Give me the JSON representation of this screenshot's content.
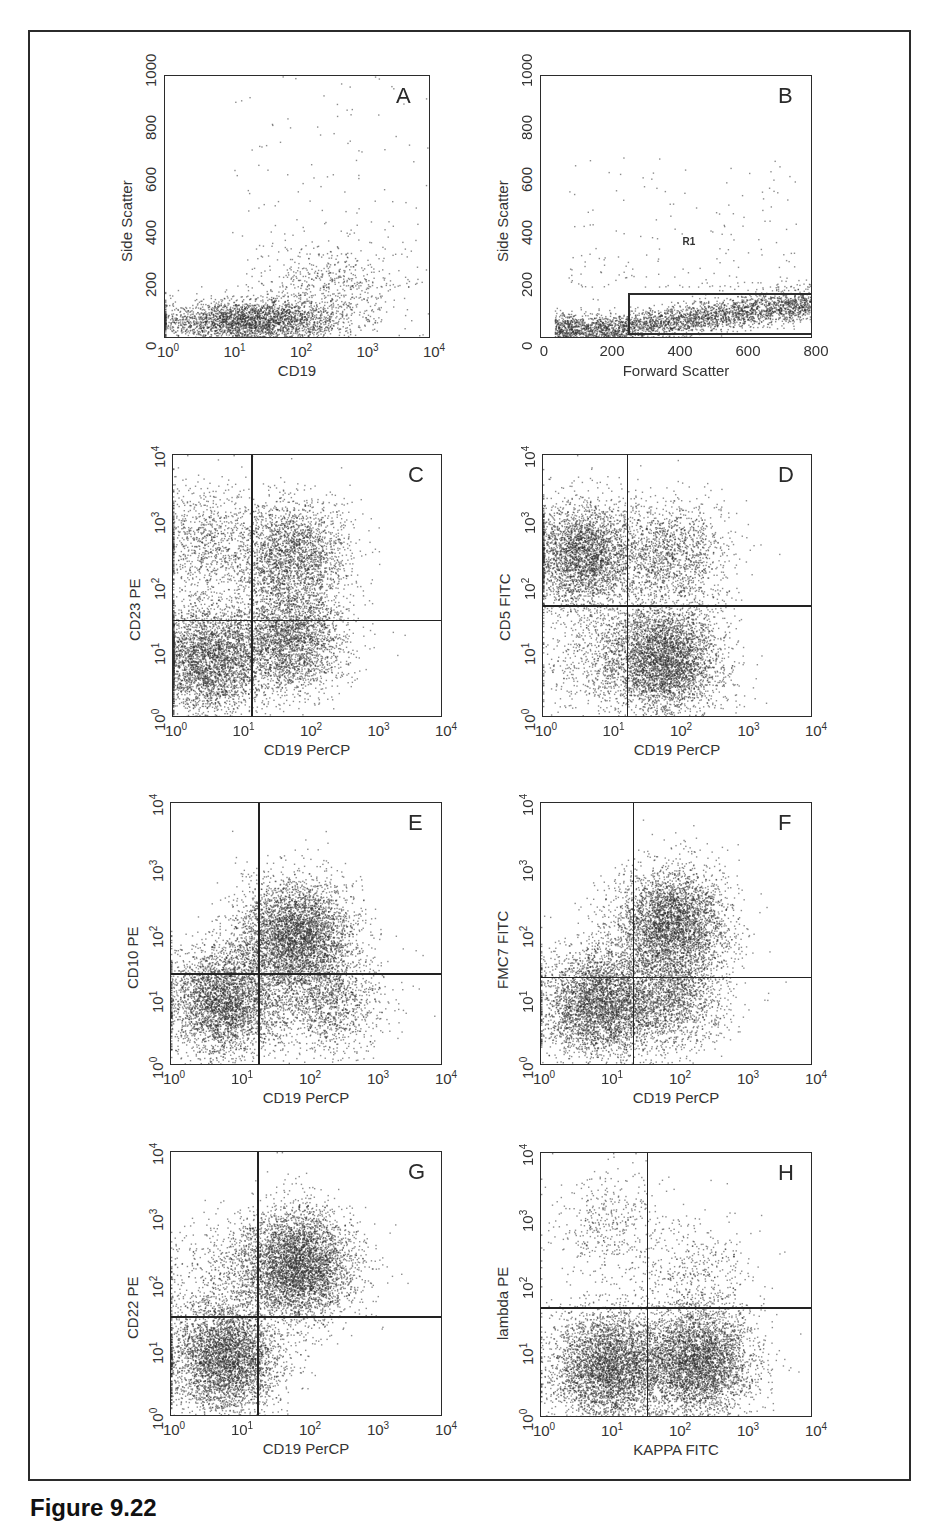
{
  "figure": {
    "caption": "Figure 9.22",
    "colors": {
      "frame": "#2b2b2b",
      "dots": "#3a3a3a",
      "background": "#ffffff"
    }
  },
  "chart_data": [
    {
      "id": "A",
      "type": "scatter",
      "title": "A",
      "xlabel": "CD19",
      "ylabel": "Side Scatter",
      "xscale": "log",
      "xlim": [
        1,
        10000
      ],
      "xticks": [
        "10^0",
        "10^1",
        "10^2",
        "10^3",
        "10^4"
      ],
      "yscale": "linear",
      "ylim": [
        0,
        1000
      ],
      "yticks": [
        "0",
        "200",
        "400",
        "600",
        "800",
        "1000"
      ],
      "populations": [
        {
          "description": "main lymphocyte cloud",
          "x_center": 20,
          "y_center": 70,
          "x_spread_log": 0.7,
          "y_spread": 40,
          "weight": 0.8
        },
        {
          "description": "diagonal tail",
          "x_center": 300,
          "y_center": 200,
          "x_spread_log": 0.5,
          "y_spread": 80,
          "weight": 0.15
        },
        {
          "description": "sparse high outliers",
          "x_range": [
            10,
            10000
          ],
          "y_range": [
            200,
            1000
          ],
          "weight": 0.05
        }
      ]
    },
    {
      "id": "B",
      "type": "scatter",
      "title": "B",
      "xlabel": "Forward Scatter",
      "ylabel": "Side Scatter",
      "xscale": "linear",
      "xlim": [
        0,
        1000
      ],
      "xticks": [
        "0",
        "200",
        "400",
        "600",
        "800",
        "1000"
      ],
      "yscale": "linear",
      "ylim": [
        0,
        1000
      ],
      "yticks": [
        "0",
        "200",
        "400",
        "600",
        "800",
        "1000"
      ],
      "gates": [
        {
          "label": "R1",
          "x": [
            320,
            1010
          ],
          "y": [
            15,
            175
          ]
        }
      ],
      "populations": [
        {
          "description": "debris",
          "x_range": [
            50,
            320
          ],
          "y_center": 40,
          "y_spread": 30,
          "weight": 0.3
        },
        {
          "description": "gated lymphocytes",
          "x_range": [
            320,
            1010
          ],
          "y_trend": "60 to 160",
          "weight": 0.65
        },
        {
          "description": "outliers",
          "x_range": [
            100,
            950
          ],
          "y_range": [
            200,
            700
          ],
          "weight": 0.05
        }
      ]
    },
    {
      "id": "C",
      "type": "scatter",
      "title": "C",
      "xlabel": "CD19 PerCP",
      "ylabel": "CD23 PE",
      "xscale": "log",
      "xlim": [
        1,
        10000
      ],
      "yscale": "log",
      "ylim": [
        1,
        10000
      ],
      "xticks": [
        "10^0",
        "10^1",
        "10^2",
        "10^3",
        "10^4"
      ],
      "yticks": [
        "10^0",
        "10^1",
        "10^2",
        "10^3",
        "10^4"
      ],
      "quadrant": {
        "x": 15,
        "y": 30
      },
      "populations": [
        {
          "x_center": 3,
          "y_center": 8,
          "weight": 0.35
        },
        {
          "x_center": 50,
          "y_center": 15,
          "weight": 0.3
        },
        {
          "x_center": 60,
          "y_center": 300,
          "weight": 0.25
        },
        {
          "x_center": 3,
          "y_center": 500,
          "weight": 0.1
        }
      ]
    },
    {
      "id": "D",
      "type": "scatter",
      "title": "D",
      "xlabel": "CD19 PerCP",
      "ylabel": "CD5 FITC",
      "xscale": "log",
      "xlim": [
        1,
        10000
      ],
      "yscale": "log",
      "ylim": [
        1,
        10000
      ],
      "xticks": [
        "10^0",
        "10^1",
        "10^2",
        "10^3",
        "10^4"
      ],
      "yticks": [
        "10^0",
        "10^1",
        "10^2",
        "10^3",
        "10^4"
      ],
      "quadrant": {
        "x": 18,
        "y": 50
      },
      "populations": [
        {
          "x_center": 4,
          "y_center": 300,
          "weight": 0.35
        },
        {
          "x_center": 60,
          "y_center": 8,
          "weight": 0.45
        },
        {
          "x_center": 80,
          "y_center": 300,
          "weight": 0.15
        },
        {
          "x_center": 5,
          "y_center": 8,
          "weight": 0.05
        }
      ]
    },
    {
      "id": "E",
      "type": "scatter",
      "title": "E",
      "xlabel": "CD19 PerCP",
      "ylabel": "CD10 PE",
      "xscale": "log",
      "xlim": [
        1,
        10000
      ],
      "yscale": "log",
      "ylim": [
        1,
        10000
      ],
      "xticks": [
        "10^0",
        "10^1",
        "10^2",
        "10^3",
        "10^4"
      ],
      "yticks": [
        "10^0",
        "10^1",
        "10^2",
        "10^3",
        "10^4"
      ],
      "quadrant": {
        "x": 20,
        "y": 25
      },
      "populations": [
        {
          "x_center": 6,
          "y_center": 10,
          "weight": 0.4
        },
        {
          "x_center": 70,
          "y_center": 100,
          "weight": 0.45
        },
        {
          "x_center": 200,
          "y_center": 10,
          "weight": 0.15
        }
      ]
    },
    {
      "id": "F",
      "type": "scatter",
      "title": "F",
      "xlabel": "CD19 PerCP",
      "ylabel": "FMC7 FITC",
      "xscale": "log",
      "xlim": [
        1,
        10000
      ],
      "yscale": "log",
      "ylim": [
        1,
        10000
      ],
      "xticks": [
        "10^0",
        "10^1",
        "10^2",
        "10^3",
        "10^4"
      ],
      "yticks": [
        "10^0",
        "10^1",
        "10^2",
        "10^3",
        "10^4"
      ],
      "quadrant": {
        "x": 23,
        "y": 22
      },
      "populations": [
        {
          "x_center": 7,
          "y_center": 9,
          "weight": 0.4
        },
        {
          "x_center": 80,
          "y_center": 150,
          "weight": 0.4
        },
        {
          "x_center": 80,
          "y_center": 12,
          "weight": 0.2
        }
      ]
    },
    {
      "id": "G",
      "type": "scatter",
      "title": "G",
      "xlabel": "CD19 PerCP",
      "ylabel": "CD22 PE",
      "xscale": "log",
      "xlim": [
        1,
        10000
      ],
      "yscale": "log",
      "ylim": [
        1,
        10000
      ],
      "xticks": [
        "10^0",
        "10^1",
        "10^2",
        "10^3",
        "10^4"
      ],
      "yticks": [
        "10^0",
        "10^1",
        "10^2",
        "10^3",
        "10^4"
      ],
      "quadrant": {
        "x": 19,
        "y": 32
      },
      "populations": [
        {
          "x_center": 6,
          "y_center": 8,
          "weight": 0.45
        },
        {
          "x_center": 70,
          "y_center": 200,
          "weight": 0.5
        },
        {
          "x_center": 5,
          "y_center": 150,
          "weight": 0.05
        }
      ]
    },
    {
      "id": "H",
      "type": "scatter",
      "title": "H",
      "xlabel": "KAPPA FITC",
      "ylabel": "lambda PE",
      "xscale": "log",
      "xlim": [
        1,
        10000
      ],
      "yscale": "log",
      "ylim": [
        1,
        10000
      ],
      "xticks": [
        "10^0",
        "10^1",
        "10^2",
        "10^3",
        "10^4"
      ],
      "yticks": [
        "10^0",
        "10^1",
        "10^2",
        "10^3",
        "10^4"
      ],
      "quadrant": {
        "x": 37,
        "y": 45
      },
      "populations": [
        {
          "x_center": 10,
          "y_center": 6,
          "weight": 0.45
        },
        {
          "x_center": 200,
          "y_center": 7,
          "weight": 0.45
        },
        {
          "x_center": 10,
          "y_center": 800,
          "weight": 0.05
        },
        {
          "x_center": 200,
          "y_center": 150,
          "weight": 0.05
        }
      ]
    }
  ],
  "panels": {
    "A": {
      "letter": "A",
      "xlabel": "CD19",
      "ylabel": "Side Scatter"
    },
    "B": {
      "letter": "B",
      "xlabel": "Forward Scatter",
      "ylabel": "Side Scatter",
      "gate_label": "R1"
    },
    "C": {
      "letter": "C",
      "xlabel": "CD19 PerCP",
      "ylabel": "CD23 PE"
    },
    "D": {
      "letter": "D",
      "xlabel": "CD19 PerCP",
      "ylabel": "CD5 FITC"
    },
    "E": {
      "letter": "E",
      "xlabel": "CD19 PerCP",
      "ylabel": "CD10 PE"
    },
    "F": {
      "letter": "F",
      "xlabel": "CD19 PerCP",
      "ylabel": "FMC7 FITC"
    },
    "G": {
      "letter": "G",
      "xlabel": "CD19 PerCP",
      "ylabel": "CD22 PE"
    },
    "H": {
      "letter": "H",
      "xlabel": "KAPPA FITC",
      "ylabel": "lambda PE"
    }
  },
  "ticks": {
    "log": [
      "0",
      "1",
      "2",
      "3",
      "4"
    ],
    "log_base": "10",
    "linear": [
      "0",
      "200",
      "400",
      "600",
      "800",
      "1000"
    ]
  }
}
